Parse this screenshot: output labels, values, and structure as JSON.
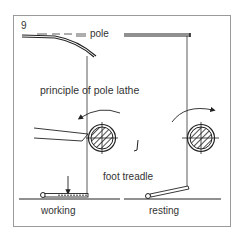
{
  "figure": {
    "number": "9",
    "title": "principle of pole lathe",
    "labels": {
      "pole": "pole",
      "foot_treadle": "foot treadle",
      "working": "working",
      "resting": "resting"
    },
    "panels": [
      {
        "name": "working",
        "pole_state": "bent",
        "treadle_state": "pressed down",
        "rotation": "counter-clockwise (toward tool)"
      },
      {
        "name": "resting",
        "pole_state": "straight",
        "treadle_state": "raised",
        "rotation": "clockwise (returning)"
      }
    ],
    "colors": {
      "ink": "#222222",
      "frame": "#9a9a9a",
      "background": "#ffffff"
    }
  }
}
